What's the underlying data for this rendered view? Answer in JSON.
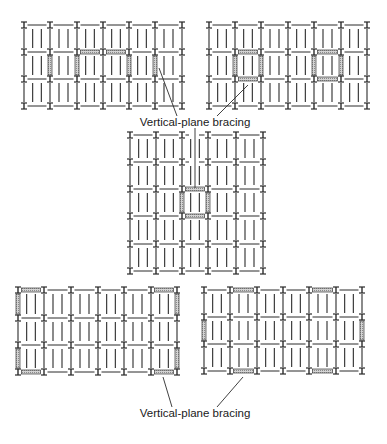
{
  "figure": {
    "labels": {
      "top": "Vertical-plane bracing",
      "bottom": "Vertical-plane bracing"
    },
    "colors": {
      "line": "#2b2b2b",
      "brace_fill": "#b8b8b8",
      "brace_edge": "#3a3a3a",
      "background": "#ffffff"
    },
    "joists_per_bay": 3,
    "grids": [
      {
        "name": "grid-top-left",
        "cols": [
          24,
          50,
          77,
          103,
          129,
          155,
          182
        ],
        "rows": [
          25,
          52,
          79,
          106
        ],
        "h_braces": [
          {
            "row": 1,
            "from": 2,
            "to": 3
          },
          {
            "row": 1,
            "from": 3,
            "to": 4
          }
        ],
        "v_braces": [
          {
            "col": 1,
            "from": 1,
            "to": 2
          },
          {
            "col": 2,
            "from": 1,
            "to": 2
          },
          {
            "col": 4,
            "from": 1,
            "to": 2
          },
          {
            "col": 5,
            "from": 1,
            "to": 2
          }
        ],
        "gaps": []
      },
      {
        "name": "grid-top-right",
        "cols": [
          209,
          235,
          261,
          288,
          314,
          341,
          367
        ],
        "rows": [
          25,
          52,
          79,
          106
        ],
        "h_braces": [
          {
            "row": 1,
            "from": 1,
            "to": 2
          },
          {
            "row": 2,
            "from": 1,
            "to": 2
          },
          {
            "row": 1,
            "from": 4,
            "to": 5
          },
          {
            "row": 2,
            "from": 4,
            "to": 5
          }
        ],
        "v_braces": [
          {
            "col": 1,
            "from": 1,
            "to": 2
          },
          {
            "col": 2,
            "from": 1,
            "to": 2
          },
          {
            "col": 4,
            "from": 1,
            "to": 2
          },
          {
            "col": 5,
            "from": 1,
            "to": 2
          }
        ],
        "gaps": []
      },
      {
        "name": "grid-center",
        "cols": [
          130,
          156,
          182,
          208,
          236,
          263
        ],
        "rows": [
          135,
          162,
          189,
          216,
          244,
          271
        ],
        "h_braces": [
          {
            "row": 2,
            "from": 2,
            "to": 3
          },
          {
            "row": 3,
            "from": 2,
            "to": 3
          }
        ],
        "v_braces": [
          {
            "col": 2,
            "from": 2,
            "to": 3
          },
          {
            "col": 3,
            "from": 2,
            "to": 3
          }
        ],
        "gaps": [
          {
            "row": 0,
            "x1": 189,
            "x2": 199
          },
          {
            "row": 1,
            "x1": 189,
            "x2": 199
          }
        ]
      },
      {
        "name": "grid-bottom-left",
        "cols": [
          18,
          44,
          71,
          98,
          124,
          151,
          177
        ],
        "rows": [
          290,
          318,
          345,
          372
        ],
        "h_braces": [
          {
            "row": 0,
            "from": 0,
            "to": 1
          },
          {
            "row": 0,
            "from": 5,
            "to": 6
          },
          {
            "row": 3,
            "from": 0,
            "to": 1
          },
          {
            "row": 3,
            "from": 5,
            "to": 6
          }
        ],
        "v_braces": [
          {
            "col": 0,
            "from": 0,
            "to": 1
          },
          {
            "col": 6,
            "from": 0,
            "to": 1
          },
          {
            "col": 0,
            "from": 2,
            "to": 3
          },
          {
            "col": 6,
            "from": 2,
            "to": 3
          }
        ],
        "gaps": []
      },
      {
        "name": "grid-bottom-right",
        "cols": [
          204,
          230,
          257,
          283,
          309,
          336,
          362
        ],
        "rows": [
          290,
          317,
          344,
          371
        ],
        "h_braces": [
          {
            "row": 0,
            "from": 1,
            "to": 2
          },
          {
            "row": 0,
            "from": 4,
            "to": 5
          },
          {
            "row": 3,
            "from": 1,
            "to": 2
          },
          {
            "row": 3,
            "from": 4,
            "to": 5
          }
        ],
        "v_braces": [
          {
            "col": 0,
            "from": 1,
            "to": 2
          },
          {
            "col": 6,
            "from": 1,
            "to": 2
          }
        ],
        "gaps": []
      }
    ],
    "leaders": [
      {
        "name": "leader-top-left",
        "points": [
          [
            159,
            68
          ],
          [
            177,
            116
          ]
        ]
      },
      {
        "name": "leader-top-right",
        "points": [
          [
            248,
            85
          ],
          [
            217,
            116
          ]
        ]
      },
      {
        "name": "leader-center",
        "points": [
          [
            195,
            128
          ],
          [
            195,
            188
          ]
        ]
      },
      {
        "name": "leader-bottom-left",
        "points": [
          [
            163,
            377
          ],
          [
            172,
            407
          ]
        ]
      },
      {
        "name": "leader-bottom-right",
        "points": [
          [
            243,
            377
          ],
          [
            217,
            407
          ]
        ]
      }
    ],
    "label_positions": {
      "top": {
        "x": 195,
        "y": 117
      },
      "bottom": {
        "x": 195,
        "y": 408
      }
    }
  }
}
